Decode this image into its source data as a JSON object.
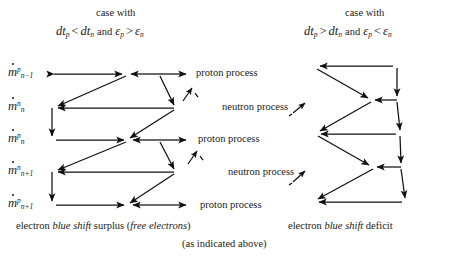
{
  "diagram": {
    "title_left": "case with",
    "title_right": "case with",
    "left_condition": {
      "a_base": "dt",
      "a_sub": "p",
      "rel1": "<",
      "b_base": "dt",
      "b_sub": "n",
      "conj": "and",
      "c_base": "ε",
      "c_sub": "p",
      "rel2": ">",
      "d_base": "ε",
      "d_sub": "n"
    },
    "right_condition": {
      "a_base": "dt",
      "a_sub": "p",
      "rel1": ">",
      "b_base": "dt",
      "b_sub": "n",
      "conj": "and",
      "c_base": "ε",
      "c_sub": "p",
      "rel2": "<",
      "d_base": "ε",
      "d_sub": "n"
    },
    "row_labels": [
      {
        "base": "m",
        "sup": "p",
        "sub": "n−1"
      },
      {
        "base": "m",
        "sup": "n",
        "sub": "n"
      },
      {
        "base": "m",
        "sup": "p",
        "sub": "n"
      },
      {
        "base": "m",
        "sup": "n",
        "sub": "n+1"
      },
      {
        "base": "m",
        "sup": "p",
        "sub": "n+1"
      }
    ],
    "process_labels": [
      "proton process",
      "neutron process",
      "proton process",
      "neutron process",
      "proton process"
    ],
    "caption_left_pre": "electron ",
    "caption_left_em": "blue shift",
    "caption_left_post": " surplus (",
    "caption_left_em2": "free electrons",
    "caption_left_end": ")",
    "caption_right_pre": "electron ",
    "caption_right_em": "blue shift",
    "caption_right_post": " deficit",
    "caption_bottom": "(as indicated above)"
  },
  "style": {
    "stroke": "#111111",
    "background": "#ffffff"
  }
}
